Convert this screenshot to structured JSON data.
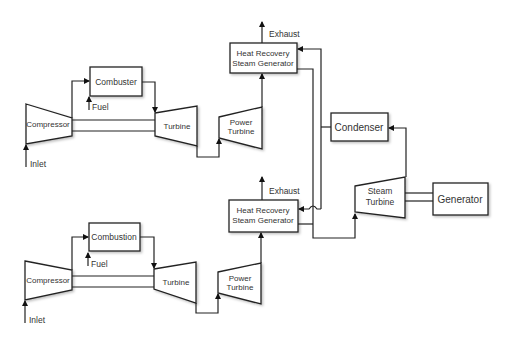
{
  "diagram": {
    "colors": {
      "stroke": "#222222",
      "fill": "#ffffff",
      "text": "#333333"
    },
    "train_top": {
      "compressor": "Compressor",
      "combustor": "Combuster",
      "turbine": "Turbine",
      "power_turbine_line1": "Power",
      "power_turbine_line2": "Turbine",
      "hrsg_line1": "Heat Recovery",
      "hrsg_line2": "Steam Generator",
      "fuel": "Fuel",
      "inlet": "Inlet",
      "exhaust": "Exhaust"
    },
    "train_bottom": {
      "compressor": "Compressor",
      "combustor": "Combustion",
      "turbine": "Turbine",
      "power_turbine_line1": "Power",
      "power_turbine_line2": "Turbine",
      "hrsg_line1": "Heat Recovery",
      "hrsg_line2": "Steam Generator",
      "fuel": "Fuel",
      "inlet": "Inlet",
      "exhaust": "Exhaust"
    },
    "steam_cycle": {
      "condenser": "Condenser",
      "steam_turbine_line1": "Steam",
      "steam_turbine_line2": "Turbine",
      "generator": "Generator"
    }
  }
}
